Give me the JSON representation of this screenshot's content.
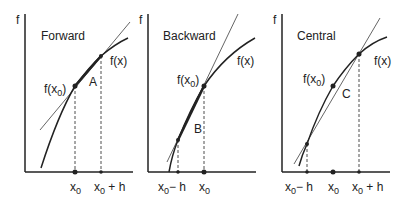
{
  "panels": [
    {
      "title": "Forward",
      "axis_y": "f",
      "fx0": "f(x",
      "fx0_sub": "0",
      "fx_label": "f(x)",
      "region": "A",
      "ticks": [
        {
          "main": "x",
          "sub": "0",
          "rest": ""
        },
        {
          "main": "x",
          "sub": "0",
          "rest": " + h"
        }
      ]
    },
    {
      "title": "Backward",
      "axis_y": "f",
      "fx0": "f(x",
      "fx0_sub": "0",
      "fx_label": "f(x)",
      "region": "B",
      "ticks": [
        {
          "main": "x",
          "sub": "0",
          "rest": "− h"
        },
        {
          "main": "x",
          "sub": "0",
          "rest": ""
        }
      ]
    },
    {
      "title": "Central",
      "axis_y": "f",
      "fx0": "f(x",
      "fx0_sub": "0",
      "fx_label": "f(x)",
      "region": "C",
      "ticks": [
        {
          "main": "x",
          "sub": "0",
          "rest": "− h"
        },
        {
          "main": "x",
          "sub": "0",
          "rest": ""
        },
        {
          "main": "x",
          "sub": "0",
          "rest": " + h"
        }
      ]
    }
  ]
}
